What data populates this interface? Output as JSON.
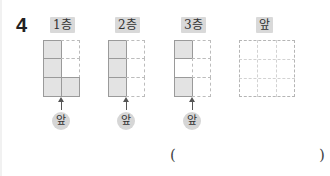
{
  "question": {
    "number": "4",
    "floors": [
      {
        "label": "1층",
        "grid": {
          "cols": 2,
          "rows": 3,
          "cells": [
            [
              "filled",
              "empty"
            ],
            [
              "filled",
              "empty"
            ],
            [
              "filled",
              "filled"
            ]
          ]
        },
        "front_marker": "앞"
      },
      {
        "label": "2층",
        "grid": {
          "cols": 2,
          "rows": 3,
          "cells": [
            [
              "filled",
              "empty"
            ],
            [
              "filled",
              "empty"
            ],
            [
              "filled",
              "empty"
            ]
          ]
        },
        "front_marker": "앞"
      },
      {
        "label": "3층",
        "grid": {
          "cols": 2,
          "rows": 3,
          "cells": [
            [
              "filled",
              "empty"
            ],
            [
              "blank",
              "empty"
            ],
            [
              "filled",
              "empty"
            ]
          ]
        },
        "front_marker": "앞"
      }
    ],
    "answer_view": {
      "label": "앞",
      "grid": {
        "cols": 3,
        "rows": 3
      }
    },
    "answer_blank": {
      "open": "(",
      "close": ")",
      "value": ""
    }
  },
  "colors": {
    "filled": "#e3e3e3",
    "label_bg": "#d9d9d9",
    "border": "#9a9a9a",
    "dashed": "#bcbcbc"
  }
}
